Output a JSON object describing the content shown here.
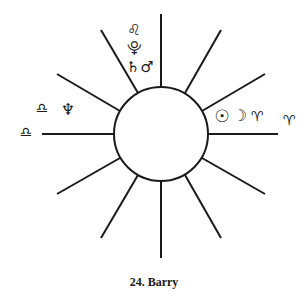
{
  "chart": {
    "caption": "24. Barry",
    "center": {
      "x": 161,
      "y": 134
    },
    "inner_circle_radius": 47,
    "spoke_length": 120,
    "spoke_count": 12,
    "line_color": "#1a1a1a",
    "spokes": [
      {
        "angle": 0,
        "x1": 208,
        "y1": 134,
        "x2": 278,
        "y2": 134
      },
      {
        "angle": 30,
        "x1": 202,
        "y1": 111,
        "x2": 265,
        "y2": 74
      },
      {
        "angle": 60,
        "x1": 185,
        "y1": 93,
        "x2": 221,
        "y2": 30
      },
      {
        "angle": 90,
        "x1": 161,
        "y1": 87,
        "x2": 161,
        "y2": 14
      },
      {
        "angle": 120,
        "x1": 138,
        "y1": 93,
        "x2": 101,
        "y2": 30
      },
      {
        "angle": 150,
        "x1": 120,
        "y1": 111,
        "x2": 57,
        "y2": 74
      },
      {
        "angle": 180,
        "x1": 114,
        "y1": 134,
        "x2": 42,
        "y2": 134
      },
      {
        "angle": 210,
        "x1": 120,
        "y1": 158,
        "x2": 57,
        "y2": 194
      },
      {
        "angle": 240,
        "x1": 138,
        "y1": 175,
        "x2": 101,
        "y2": 238
      },
      {
        "angle": 270,
        "x1": 161,
        "y1": 181,
        "x2": 161,
        "y2": 258
      },
      {
        "angle": 300,
        "x1": 185,
        "y1": 175,
        "x2": 221,
        "y2": 238
      },
      {
        "angle": 330,
        "x1": 202,
        "y1": 158,
        "x2": 265,
        "y2": 194
      }
    ]
  },
  "glyphs": {
    "leo": {
      "symbol": "♌",
      "name": "Leo",
      "x": 134,
      "y": 30,
      "size": 15
    },
    "pluto": {
      "symbol": "⯓",
      "name": "Pluto",
      "x": 134,
      "y": 48,
      "size": 15
    },
    "saturn": {
      "symbol": "♄",
      "name": "Saturn",
      "x": 133,
      "y": 67,
      "size": 15
    },
    "mars": {
      "symbol": "♂",
      "name": "Mars",
      "x": 147,
      "y": 67,
      "size": 15
    },
    "sun": {
      "symbol": "☉",
      "name": "Sun",
      "x": 222,
      "y": 116,
      "size": 17
    },
    "moon": {
      "symbol": "☽",
      "name": "Moon",
      "x": 240,
      "y": 116,
      "size": 16
    },
    "aries_inner": {
      "symbol": "♈",
      "name": "Aries",
      "x": 257,
      "y": 116,
      "size": 14
    },
    "aries_outer": {
      "symbol": "♈",
      "name": "Aries",
      "x": 289,
      "y": 120,
      "size": 14
    },
    "libra_inner": {
      "symbol": "♎",
      "name": "Libra",
      "x": 42,
      "y": 108,
      "size": 14
    },
    "neptune": {
      "symbol": "♆",
      "name": "Neptune",
      "x": 68,
      "y": 110,
      "size": 16
    },
    "libra_outer": {
      "symbol": "♎",
      "name": "Libra",
      "x": 26,
      "y": 132,
      "size": 14
    }
  }
}
